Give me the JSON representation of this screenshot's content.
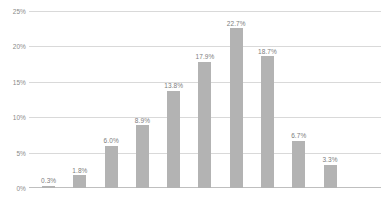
{
  "chart_data": {
    "type": "bar",
    "title": "",
    "subtitle": "",
    "xlabel": "",
    "ylabel": "",
    "ylim": [
      0,
      25
    ],
    "ytick_labels": [
      "0%",
      "5%",
      "10%",
      "15%",
      "20%",
      "25%"
    ],
    "ytick_values": [
      0,
      5,
      10,
      15,
      20,
      25
    ],
    "grid": true,
    "legend": false,
    "legend_position": "none",
    "categories": [
      "",
      "",
      "",
      "",
      "",
      "",
      "",
      "",
      "",
      "",
      ""
    ],
    "values": [
      0.3,
      1.8,
      6.0,
      8.9,
      13.8,
      17.9,
      22.7,
      18.7,
      6.7,
      3.3,
      0.0
    ],
    "data_labels": [
      "0.3%",
      "1.8%",
      "6.0%",
      "8.9%",
      "13.8%",
      "17.9%",
      "22.7%",
      "18.7%",
      "6.7%",
      "3.3%",
      ""
    ],
    "bar_color": "#b3b3b3",
    "gridline_color": "#d9d9d9",
    "axis_color": "#bfbfbf",
    "label_color": "#7d7d7d",
    "tick_color": "#8a8a8a",
    "background": "#ffffff"
  }
}
